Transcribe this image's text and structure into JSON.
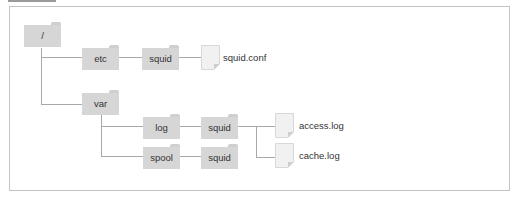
{
  "diagram": {
    "title_bar": "",
    "nodes": {
      "root": {
        "label": "/",
        "type": "folder"
      },
      "etc": {
        "label": "etc",
        "type": "folder"
      },
      "etc_squid": {
        "label": "squid",
        "type": "folder"
      },
      "squid_conf": {
        "label": "squid.conf",
        "type": "file"
      },
      "var": {
        "label": "var",
        "type": "folder"
      },
      "log": {
        "label": "log",
        "type": "folder"
      },
      "log_squid": {
        "label": "squid",
        "type": "folder"
      },
      "access_log": {
        "label": "access.log",
        "type": "file"
      },
      "cache_log": {
        "label": "cache.log",
        "type": "file"
      },
      "spool": {
        "label": "spool",
        "type": "folder"
      },
      "spool_squid": {
        "label": "squid",
        "type": "folder"
      }
    },
    "colors": {
      "folder": "#d6d6d6",
      "line": "#a8a8a8",
      "frame": "#c4c4c4",
      "text": "#333333"
    }
  }
}
